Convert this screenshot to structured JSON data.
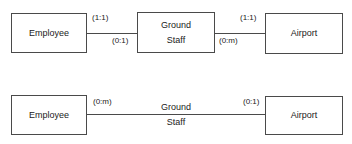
{
  "diagram": {
    "type": "entity-relationship",
    "top": {
      "entities": [
        {
          "name": "Employee"
        },
        {
          "name": "Ground Staff",
          "lines": [
            "Ground",
            "Staff"
          ]
        },
        {
          "name": "Airport"
        }
      ],
      "cardinalities": {
        "employee_side": "(1:1)",
        "ground_staff_left": "(0:1)",
        "airport_side": "(1:1)",
        "ground_staff_right": "(0:m)"
      }
    },
    "bottom": {
      "entities": [
        {
          "name": "Employee"
        },
        {
          "name": "Airport"
        }
      ],
      "relationship": {
        "lines": [
          "Ground",
          "Staff"
        ]
      },
      "cardinalities": {
        "employee_side": "(0:m)",
        "airport_side": "(0:1)"
      }
    }
  }
}
